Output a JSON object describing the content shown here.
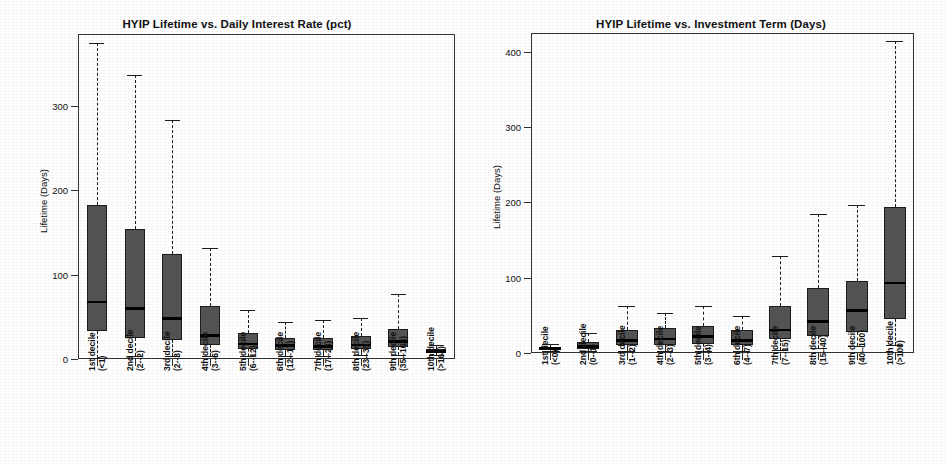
{
  "figure": {
    "background": "#ffffff",
    "box_fill": "#545454",
    "line_color": "#1c1c1c"
  },
  "chart_data": [
    {
      "type": "box",
      "title": "HYIP Lifetime vs. Daily Interest Rate (pct)",
      "xlabel": "",
      "ylabel": "Lifetime (Days)",
      "ylim": [
        0,
        385
      ],
      "yticks": [
        0,
        100,
        200,
        300
      ],
      "ytick_labels": [
        "0",
        "100",
        "200",
        "300"
      ],
      "grid": false,
      "legend": "none",
      "categories": [
        "1st decile\n(<1)",
        "2nd decile\n(2--2)",
        "3rd decile\n(2--3)",
        "4th decile\n(3--6)",
        "5th decile\n(6--12)",
        "6th decile\n(12--17)",
        "7th decile\n(17--23)",
        "8th decile\n(23--35)",
        "9th decile\n(35--164)",
        "10th decile\n(>164)"
      ],
      "category_lines": [
        [
          "1st decile",
          "(<1)"
        ],
        [
          "2nd decile",
          "(2--2)"
        ],
        [
          "3rd decile",
          "(2--3)"
        ],
        [
          "4th decile",
          "(3--6)"
        ],
        [
          "5th decile",
          "(6--12)"
        ],
        [
          "6th decile",
          "(12--17)"
        ],
        [
          "7th decile",
          "(17--23)"
        ],
        [
          "8th decile",
          "(23--35)"
        ],
        [
          "9th decile",
          "(35--164)"
        ],
        [
          "10th decile",
          "(>164)"
        ]
      ],
      "boxes": [
        {
          "label": "1st decile (<1)",
          "whisker_low": 1,
          "q1": 33,
          "median": 68,
          "q3": 183,
          "whisker_high": 374
        },
        {
          "label": "2nd decile (2--2)",
          "whisker_low": 4,
          "q1": 25,
          "median": 60,
          "q3": 154,
          "whisker_high": 337
        },
        {
          "label": "3rd decile (2--3)",
          "whisker_low": 3,
          "q1": 22,
          "median": 48,
          "q3": 124,
          "whisker_high": 283
        },
        {
          "label": "4th decile (3--6)",
          "whisker_low": 3,
          "q1": 17,
          "median": 28,
          "q3": 63,
          "whisker_high": 132
        },
        {
          "label": "5th decile (6--12)",
          "whisker_low": 4,
          "q1": 12,
          "median": 18,
          "q3": 31,
          "whisker_high": 58
        },
        {
          "label": "6th decile (12--17)",
          "whisker_low": 4,
          "q1": 11,
          "median": 16,
          "q3": 25,
          "whisker_high": 44
        },
        {
          "label": "7th decile (17--23)",
          "whisker_low": 4,
          "q1": 11,
          "median": 15,
          "q3": 25,
          "whisker_high": 46
        },
        {
          "label": "8th decile (23--35)",
          "whisker_low": 5,
          "q1": 12,
          "median": 17,
          "q3": 27,
          "whisker_high": 49
        },
        {
          "label": "9th decile (35--164)",
          "whisker_low": 5,
          "q1": 14,
          "median": 21,
          "q3": 35,
          "whisker_high": 77
        },
        {
          "label": "10th decile (>164)",
          "whisker_low": 5,
          "q1": 7,
          "median": 9,
          "q3": 12,
          "whisker_high": 17
        }
      ]
    },
    {
      "type": "box",
      "title": "HYIP Lifetime vs. Investment Term (Days)",
      "xlabel": "",
      "ylabel": "Lifetime (Days)",
      "ylim": [
        0,
        425
      ],
      "yticks": [
        0,
        100,
        200,
        300,
        400
      ],
      "ytick_labels": [
        "0",
        "100",
        "200",
        "300",
        "400"
      ],
      "grid": false,
      "legend": "none",
      "categories": [
        "1st decile\n(<0)",
        "2nd decile\n(0--1)",
        "3rd decile\n(1--2)",
        "4th decile\n(2--3)",
        "5th decile\n(3--4)",
        "6th decile\n(4--7)",
        "7th decile\n(7--15)",
        "8th decile\n(15--40)",
        "9th decile\n(40--100)",
        "10th decile\n(>100)"
      ],
      "category_lines": [
        [
          "1st decile",
          "(<0)"
        ],
        [
          "2nd decile",
          "(0--1)"
        ],
        [
          "3rd decile",
          "(1--2)"
        ],
        [
          "4th decile",
          "(2--3)"
        ],
        [
          "5th decile",
          "(3--4)"
        ],
        [
          "6th decile",
          "(4--7)"
        ],
        [
          "7th decile",
          "(7--15)"
        ],
        [
          "8th decile",
          "(15--40)"
        ],
        [
          "9th decile",
          "(40--100)"
        ],
        [
          "10th decile",
          "(>100)"
        ]
      ],
      "boxes": [
        {
          "label": "1st decile (<0)",
          "whisker_low": 2,
          "q1": 4,
          "median": 6,
          "q3": 8,
          "whisker_high": 12
        },
        {
          "label": "2nd decile (0--1)",
          "whisker_low": 2,
          "q1": 5,
          "median": 9,
          "q3": 15,
          "whisker_high": 26
        },
        {
          "label": "3rd decile (1--2)",
          "whisker_low": 3,
          "q1": 10,
          "median": 17,
          "q3": 31,
          "whisker_high": 62
        },
        {
          "label": "4th decile (2--3)",
          "whisker_low": 3,
          "q1": 11,
          "median": 19,
          "q3": 33,
          "whisker_high": 53
        },
        {
          "label": "5th decile (3--4)",
          "whisker_low": 3,
          "q1": 12,
          "median": 22,
          "q3": 36,
          "whisker_high": 62
        },
        {
          "label": "6th decile (4--7)",
          "whisker_low": 3,
          "q1": 11,
          "median": 17,
          "q3": 31,
          "whisker_high": 49
        },
        {
          "label": "7th decile (7--15)",
          "whisker_low": 4,
          "q1": 19,
          "median": 31,
          "q3": 62,
          "whisker_high": 129
        },
        {
          "label": "8th decile (15--40)",
          "whisker_low": 7,
          "q1": 23,
          "median": 42,
          "q3": 86,
          "whisker_high": 184
        },
        {
          "label": "9th decile (40--100)",
          "whisker_low": 9,
          "q1": 28,
          "median": 57,
          "q3": 96,
          "whisker_high": 196
        },
        {
          "label": "10th decile (>100)",
          "whisker_low": 10,
          "q1": 45,
          "median": 93,
          "q3": 194,
          "whisker_high": 414
        }
      ]
    }
  ]
}
